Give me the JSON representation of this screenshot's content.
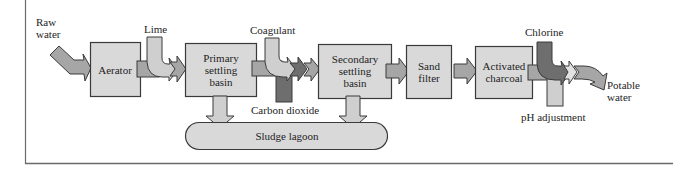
{
  "diagram": {
    "colors": {
      "box_fill": "#d9d9d9",
      "flow_medium": "#a6a6a6",
      "flow_dark": "#6e6e6e",
      "flow_light": "#cfcfcf",
      "outline": "#3a3a3a",
      "frame": "#6a6a6a"
    },
    "inputs": {
      "raw_water": {
        "line1": "Raw",
        "line2": "water"
      },
      "lime": "Lime",
      "coagulant": "Coagulant",
      "carbon_dioxide": "Carbon dioxide",
      "chlorine": "Chlorine",
      "ph_adjustment": "pH adjustment"
    },
    "stages": [
      {
        "id": "aerator",
        "lines": [
          "Aerator"
        ]
      },
      {
        "id": "primary",
        "lines": [
          "Primary",
          "settling",
          "basin"
        ]
      },
      {
        "id": "secondary",
        "lines": [
          "Secondary",
          "settling",
          "basin"
        ]
      },
      {
        "id": "sand",
        "lines": [
          "Sand",
          "filter"
        ]
      },
      {
        "id": "charcoal",
        "lines": [
          "Activated",
          "charcoal"
        ]
      }
    ],
    "sludge": "Sludge lagoon",
    "output": {
      "line1": "Potable",
      "line2": "water"
    }
  }
}
